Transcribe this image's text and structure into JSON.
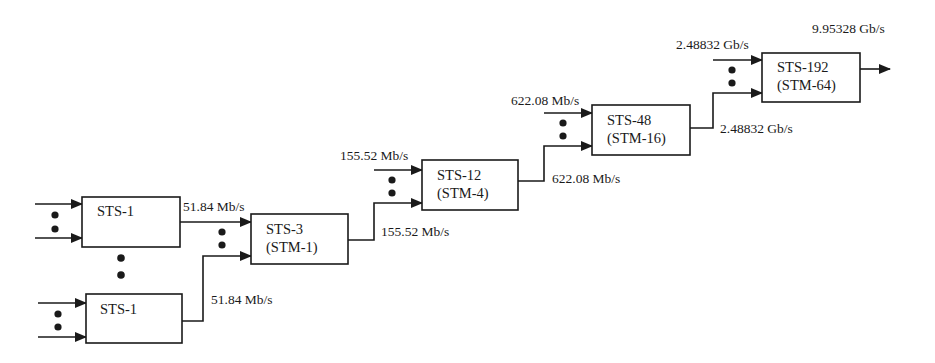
{
  "diagram": {
    "colors": {
      "stroke": "#1a1a1a",
      "background": "#ffffff"
    },
    "blocks": [
      {
        "id": "sts1a",
        "line1": "STS-1",
        "line2": ""
      },
      {
        "id": "sts1b",
        "line1": "STS-1",
        "line2": ""
      },
      {
        "id": "sts3",
        "line1": "STS-3",
        "line2": "(STM-1)"
      },
      {
        "id": "sts12",
        "line1": "STS-12",
        "line2": "(STM-4)"
      },
      {
        "id": "sts48",
        "line1": "STS-48",
        "line2": "(STM-16)"
      },
      {
        "id": "sts192",
        "line1": "STS-192",
        "line2": "(STM-64)"
      }
    ],
    "rates": {
      "sts1a_out": "51.84 Mb/s",
      "sts1b_out": "51.84 Mb/s",
      "sts3_in_top": "155.52 Mb/s",
      "sts3_out": "155.52 Mb/s",
      "sts12_in_top": "622.08 Mb/s",
      "sts12_out": "622.08 Mb/s",
      "sts48_in_top": "2.48832 Gb/s",
      "sts48_out": "2.48832 Gb/s",
      "sts192_out": "9.95328 Gb/s"
    }
  }
}
